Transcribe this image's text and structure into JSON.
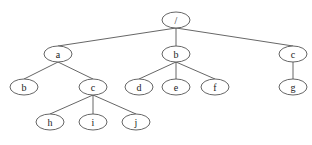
{
  "diagram": {
    "type": "tree",
    "node_rx": 14,
    "node_ry": 8,
    "nodes": [
      {
        "id": "root",
        "label": "/",
        "x": 176,
        "y": 20
      },
      {
        "id": "a",
        "label": "a",
        "x": 58,
        "y": 54
      },
      {
        "id": "b1",
        "label": "b",
        "x": 176,
        "y": 54
      },
      {
        "id": "c1",
        "label": "c",
        "x": 293,
        "y": 54
      },
      {
        "id": "b2",
        "label": "b",
        "x": 24,
        "y": 87
      },
      {
        "id": "c2",
        "label": "c",
        "x": 93,
        "y": 87
      },
      {
        "id": "d",
        "label": "d",
        "x": 139,
        "y": 87
      },
      {
        "id": "e",
        "label": "e",
        "x": 176,
        "y": 87
      },
      {
        "id": "f",
        "label": "f",
        "x": 215,
        "y": 87
      },
      {
        "id": "g",
        "label": "g",
        "x": 293,
        "y": 87
      },
      {
        "id": "h",
        "label": "h",
        "x": 50,
        "y": 122
      },
      {
        "id": "i",
        "label": "i",
        "x": 93,
        "y": 122
      },
      {
        "id": "j",
        "label": "j",
        "x": 136,
        "y": 122
      }
    ],
    "edges": [
      [
        "root",
        "a"
      ],
      [
        "root",
        "b1"
      ],
      [
        "root",
        "c1"
      ],
      [
        "a",
        "b2"
      ],
      [
        "a",
        "c2"
      ],
      [
        "b1",
        "d"
      ],
      [
        "b1",
        "e"
      ],
      [
        "b1",
        "f"
      ],
      [
        "c1",
        "g"
      ],
      [
        "c2",
        "h"
      ],
      [
        "c2",
        "i"
      ],
      [
        "c2",
        "j"
      ]
    ]
  }
}
